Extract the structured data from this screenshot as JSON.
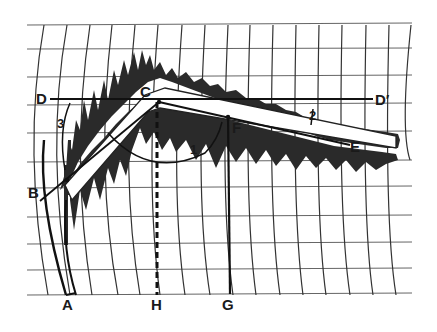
{
  "diagram": {
    "type": "geometric construction over curvilinear grid with spectrogram-like trace",
    "colors": {
      "background": "#ffffff",
      "grid": "#555555",
      "trace": "#2a2a2a",
      "construction": "#111111"
    },
    "points": {
      "A": "A",
      "B": "B",
      "C": "C",
      "D": "D",
      "D_prime": "D′",
      "E": "E",
      "F": "F",
      "G": "G",
      "H": "H"
    },
    "angle_labels": {
      "a1": "1",
      "a2": "2",
      "a3": "3"
    }
  }
}
